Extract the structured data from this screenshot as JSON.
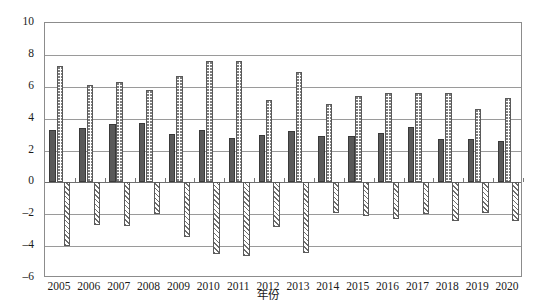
{
  "chart_data": {
    "type": "bar",
    "title": "",
    "xlabel": "年份",
    "ylabel": "",
    "ylim": [
      -6,
      10
    ],
    "ytick_step": 2,
    "yticks": [
      10,
      8,
      6,
      4,
      2,
      0,
      -2,
      -4,
      -6
    ],
    "grid": true,
    "legend": "none",
    "categories": [
      "2005",
      "2006",
      "2007",
      "2008",
      "2009",
      "2010",
      "2011",
      "2012",
      "2013",
      "2014",
      "2015",
      "2016",
      "2017",
      "2018",
      "2019",
      "2020"
    ],
    "series": [
      {
        "name": "series-solid",
        "pattern": "solid-dark-gray",
        "values": [
          3.3,
          3.4,
          3.65,
          3.75,
          3.05,
          3.3,
          2.8,
          3.0,
          3.25,
          2.9,
          2.9,
          3.1,
          3.5,
          2.7,
          2.7,
          2.6
        ]
      },
      {
        "name": "series-dotted",
        "pattern": "dotted",
        "values": [
          7.3,
          6.1,
          6.3,
          5.8,
          6.65,
          7.6,
          7.6,
          5.2,
          6.95,
          4.9,
          5.4,
          5.6,
          5.6,
          5.6,
          4.6,
          5.3
        ]
      },
      {
        "name": "series-hatch",
        "pattern": "diagonal-hatch",
        "values": [
          -4.0,
          -2.7,
          -2.75,
          -2.0,
          -3.4,
          -4.5,
          -4.6,
          -2.8,
          -4.4,
          -1.9,
          -2.1,
          -2.3,
          -2.0,
          -2.4,
          -1.9,
          -2.4
        ]
      }
    ]
  },
  "axis": {
    "x_title": "年份"
  }
}
